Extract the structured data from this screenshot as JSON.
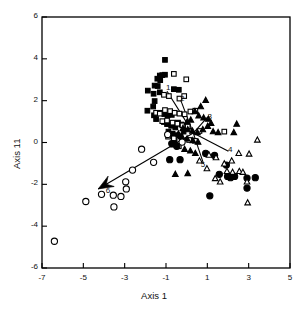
{
  "figure": {
    "type": "scatter",
    "background": "#ffffff",
    "ink": "#000000"
  },
  "axes": {
    "x_label": "Axis 1",
    "y_label": "Axis 11",
    "x_ticks": [
      -7,
      -5,
      -3,
      -1,
      1,
      3,
      5
    ],
    "y_ticks": [
      6,
      4,
      2,
      0,
      -2,
      -4,
      -6
    ],
    "x_tick_labels": [
      "-7",
      "-5",
      "-3",
      "-1",
      "1",
      "3",
      "5"
    ],
    "y_tick_labels": [
      "6",
      "4",
      "2",
      "0",
      "-2",
      "-4",
      "-6"
    ],
    "xlim": [
      -7,
      5
    ],
    "ylim": [
      -6,
      6
    ],
    "grid": false,
    "frame": true
  },
  "chart_data": {
    "type": "scatter",
    "title": "",
    "xlabel": "Axis 1",
    "ylabel": "Axis 11",
    "xlim": [
      -7,
      5
    ],
    "ylim": [
      -6,
      6
    ],
    "grid": false,
    "legend": "none",
    "series": [
      {
        "name": "filled-square",
        "marker": "filled-square",
        "color": "#000000",
        "points": [
          [
            -1.05,
            3.95
          ],
          [
            -1.3,
            3.2
          ],
          [
            -1.18,
            3.22
          ],
          [
            -1.05,
            3.24
          ],
          [
            -1.42,
            3.05
          ],
          [
            -1.28,
            2.98
          ],
          [
            -1.55,
            2.72
          ],
          [
            -1.4,
            2.7
          ],
          [
            -1.88,
            2.48
          ],
          [
            -1.3,
            2.4
          ],
          [
            -1.6,
            2.33
          ],
          [
            -0.62,
            2.55
          ],
          [
            -0.38,
            2.52
          ],
          [
            -1.55,
            1.98
          ],
          [
            -1.62,
            1.72
          ],
          [
            -1.9,
            1.52
          ],
          [
            -1.58,
            1.3
          ],
          [
            -1.48,
            1.12
          ],
          [
            -1.22,
            1.42
          ],
          [
            -1.08,
            1.36
          ],
          [
            -0.92,
            1.3
          ],
          [
            -0.72,
            1.32
          ],
          [
            -1.1,
            0.98
          ],
          [
            -0.95,
            0.88
          ],
          [
            -0.75,
            0.8
          ],
          [
            -0.55,
            0.72
          ],
          [
            -0.42,
            0.95
          ],
          [
            -0.25,
            0.86
          ],
          [
            -0.88,
            0.52
          ],
          [
            -0.68,
            0.42
          ],
          [
            -0.48,
            0.35
          ],
          [
            -0.3,
            0.3
          ],
          [
            -0.58,
            0.1
          ],
          [
            -0.15,
            0.52
          ]
        ]
      },
      {
        "name": "open-square",
        "marker": "open-square",
        "color": "#000000",
        "points": [
          [
            -0.62,
            3.28
          ],
          [
            -0.02,
            3.02
          ],
          [
            -1.1,
            2.28
          ],
          [
            -0.86,
            2.22
          ],
          [
            -0.35,
            2.1
          ],
          [
            -0.12,
            2.22
          ],
          [
            -1.48,
            1.42
          ],
          [
            -1.3,
            1.38
          ],
          [
            -1.05,
            1.55
          ],
          [
            -0.8,
            1.5
          ],
          [
            -0.58,
            1.42
          ],
          [
            -0.35,
            1.38
          ],
          [
            -0.1,
            1.35
          ],
          [
            0.18,
            1.48
          ],
          [
            0.42,
            1.52
          ],
          [
            -1.18,
            1.02
          ],
          [
            -0.95,
            1.05
          ],
          [
            -0.68,
            0.95
          ],
          [
            -0.45,
            0.9
          ],
          [
            -0.2,
            0.82
          ],
          [
            0.05,
            0.78
          ],
          [
            0.62,
            0.55
          ],
          [
            -0.9,
            0.28
          ],
          [
            -0.62,
            0.2
          ],
          [
            0.12,
            0.12
          ],
          [
            0.4,
            0.08
          ],
          [
            1.82,
            0.52
          ],
          [
            -0.68,
            -0.1
          ],
          [
            -0.38,
            -0.18
          ]
        ]
      },
      {
        "name": "filled-triangle",
        "marker": "filled-triangle",
        "color": "#000000",
        "points": [
          [
            0.92,
            2.02
          ],
          [
            0.68,
            1.72
          ],
          [
            0.4,
            1.48
          ],
          [
            0.58,
            1.28
          ],
          [
            0.82,
            1.18
          ],
          [
            1.05,
            1.12
          ],
          [
            0.2,
            1.08
          ],
          [
            0.02,
            0.98
          ],
          [
            -0.18,
            0.68
          ],
          [
            0.05,
            0.62
          ],
          [
            0.28,
            0.55
          ],
          [
            0.52,
            0.48
          ],
          [
            0.78,
            0.62
          ],
          [
            1.02,
            0.78
          ],
          [
            1.18,
            0.92
          ],
          [
            1.28,
            0.52
          ],
          [
            -0.4,
            0.42
          ],
          [
            -0.22,
            0.25
          ],
          [
            0.02,
            0.18
          ],
          [
            0.3,
            0.1
          ],
          [
            0.55,
            0.02
          ],
          [
            1.52,
            0.48
          ],
          [
            2.28,
            0.48
          ],
          [
            2.42,
            0.88
          ],
          [
            -0.1,
            -0.32
          ],
          [
            0.18,
            -0.4
          ],
          [
            0.42,
            -0.52
          ],
          [
            0.05,
            -1.48
          ],
          [
            -0.55,
            -1.52
          ]
        ]
      },
      {
        "name": "filled-circle",
        "marker": "filled-circle",
        "color": "#000000",
        "points": [
          [
            -0.72,
            -0.05
          ],
          [
            -0.48,
            -0.18
          ],
          [
            -0.82,
            -0.82
          ],
          [
            -0.32,
            -0.82
          ],
          [
            0.92,
            -0.52
          ],
          [
            1.35,
            -0.62
          ],
          [
            1.58,
            -1.52
          ],
          [
            1.92,
            -1.08
          ],
          [
            2.12,
            -1.68
          ],
          [
            2.32,
            -1.62
          ],
          [
            2.92,
            -1.7
          ],
          [
            3.32,
            -1.68
          ],
          [
            1.12,
            -2.55
          ],
          [
            2.92,
            -2.18
          ],
          [
            1.98,
            -1.62
          ]
        ]
      },
      {
        "name": "open-triangle",
        "marker": "open-triangle",
        "color": "#000000",
        "points": [
          [
            0.62,
            -0.88
          ],
          [
            1.08,
            -0.6
          ],
          [
            1.42,
            -0.72
          ],
          [
            1.82,
            -1.02
          ],
          [
            1.95,
            -1.38
          ],
          [
            2.18,
            -0.88
          ],
          [
            2.22,
            -1.42
          ],
          [
            2.55,
            -1.38
          ],
          [
            2.72,
            -1.42
          ],
          [
            2.92,
            -1.88
          ],
          [
            2.52,
            -0.52
          ],
          [
            3.02,
            -0.55
          ],
          [
            3.42,
            0.12
          ],
          [
            1.38,
            -1.72
          ],
          [
            1.62,
            -1.88
          ],
          [
            2.95,
            -2.88
          ],
          [
            0.98,
            -1.25
          ]
        ]
      },
      {
        "name": "open-circle",
        "marker": "open-circle",
        "color": "#000000",
        "points": [
          [
            -0.92,
            0.38
          ],
          [
            -0.22,
            0.02
          ],
          [
            -2.18,
            -0.32
          ],
          [
            -2.62,
            -1.32
          ],
          [
            -1.6,
            -0.95
          ],
          [
            -2.95,
            -1.88
          ],
          [
            -3.18,
            -2.58
          ],
          [
            -3.55,
            -2.52
          ],
          [
            -3.52,
            -3.08
          ],
          [
            -4.12,
            -2.48
          ],
          [
            -4.88,
            -2.82
          ],
          [
            -6.4,
            -4.72
          ],
          [
            -2.92,
            -2.22
          ]
        ]
      }
    ],
    "vectors": [
      {
        "label": "1",
        "from": [
          0.32,
          0.45
        ],
        "to": [
          -0.95,
          2.45
        ],
        "label_pos": [
          -0.9,
          2.58
        ]
      },
      {
        "label": "2",
        "from": [
          0.32,
          0.45
        ],
        "to": [
          -0.28,
          2.0
        ],
        "label_pos": [
          -0.22,
          2.05
        ]
      },
      {
        "label": "3",
        "from": [
          0.32,
          0.45
        ],
        "to": [
          1.02,
          1.22
        ],
        "label_pos": [
          1.1,
          1.18
        ]
      },
      {
        "label": "4",
        "from": [
          0.32,
          0.45
        ],
        "to": [
          2.02,
          -0.42
        ],
        "label_pos": [
          2.1,
          -0.42
        ]
      },
      {
        "label": "5",
        "from": [
          0.32,
          0.45
        ],
        "to": [
          0.82,
          -1.02
        ],
        "label_pos": [
          0.78,
          -1.12
        ]
      },
      {
        "label": "6",
        "from": [
          0.32,
          0.45
        ],
        "to": [
          -4.28,
          -2.22
        ],
        "label_pos": [
          -3.82,
          -2.35
        ],
        "arrowhead": true
      }
    ]
  }
}
